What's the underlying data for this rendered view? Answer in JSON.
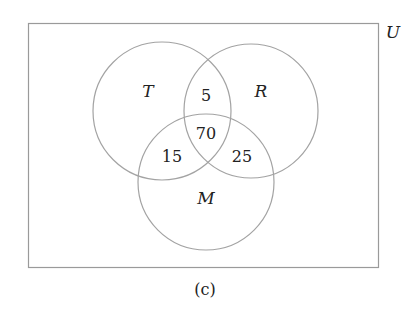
{
  "diagram": {
    "type": "venn",
    "universe_label": "U",
    "caption": "(c)",
    "sets": [
      {
        "name": "T",
        "label": "T"
      },
      {
        "name": "R",
        "label": "R"
      },
      {
        "name": "M",
        "label": "M"
      }
    ],
    "regions": {
      "T_and_R_only": "5",
      "T_and_R_and_M": "70",
      "T_and_M_only": "15",
      "R_and_M_only": "25"
    },
    "colors": {
      "stroke": "#a3a3a3",
      "text": "#222222",
      "background": "#ffffff"
    }
  }
}
